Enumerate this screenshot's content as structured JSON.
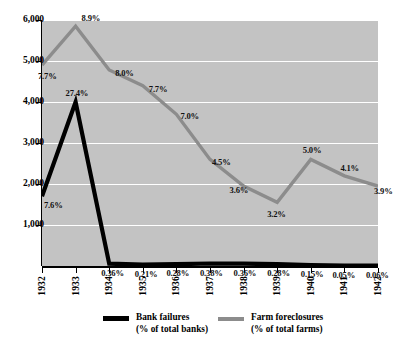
{
  "chart_data": {
    "type": "line",
    "title": "",
    "xlabel": "",
    "ylabel": "",
    "categories": [
      "1932",
      "1933",
      "1934",
      "1935",
      "1936",
      "1937",
      "1938",
      "1939",
      "1940",
      "1941",
      "1942"
    ],
    "ylim": [
      0,
      6000
    ],
    "y_ticks": [
      "1,000",
      "2,000",
      "3,000",
      "4,000",
      "5,000",
      "6,000"
    ],
    "y_tick_values": [
      1000,
      2000,
      3000,
      4000,
      5000,
      6000
    ],
    "grid": true,
    "legend_position": "bottom",
    "series": [
      {
        "name": "Bank failures",
        "unit_note": "(% of total banks)",
        "color": "#000000",
        "point_labels": [
          "7.6%",
          "27.4%",
          "0.36%",
          "0.21%",
          "0.28%",
          "0.38%",
          "0.36%",
          "0.28%",
          "0.15%",
          "0.05%",
          "0.06%"
        ],
        "percent_values": [
          7.6,
          27.4,
          0.36,
          0.21,
          0.28,
          0.38,
          0.36,
          0.28,
          0.15,
          0.05,
          0.06
        ],
        "values": [
          1700,
          4000,
          57,
          34,
          44,
          60,
          57,
          44,
          24,
          8,
          10
        ]
      },
      {
        "name": "Farm foreclosures",
        "unit_note": "(% of total farms)",
        "color": "#8c8c8c",
        "point_labels": [
          "7.7%",
          "8.9%",
          "8.0%",
          "7.7%",
          "7.0%",
          "4.5%",
          "3.6%",
          "3.2%",
          "5.0%",
          "4.1%",
          "3.9%"
        ],
        "percent_values": [
          7.7,
          8.9,
          8.0,
          7.7,
          7.0,
          4.5,
          3.6,
          3.2,
          5.0,
          4.1,
          3.9
        ],
        "values": [
          4900,
          5850,
          4780,
          4400,
          3700,
          2600,
          1950,
          1550,
          2600,
          2200,
          1950
        ]
      }
    ]
  },
  "legend": {
    "bank": {
      "line1": "Bank failures",
      "line2": "(% of total banks)"
    },
    "farm": {
      "line1": "Farm foreclosures",
      "line2": "(% of total farms)"
    }
  },
  "colors": {
    "plot_background": "#c3c3c3",
    "gridline": "#ffffff",
    "bank_line": "#000000",
    "farm_line": "#8c8c8c",
    "axis": "#000000",
    "page_background": "#ffffff"
  }
}
